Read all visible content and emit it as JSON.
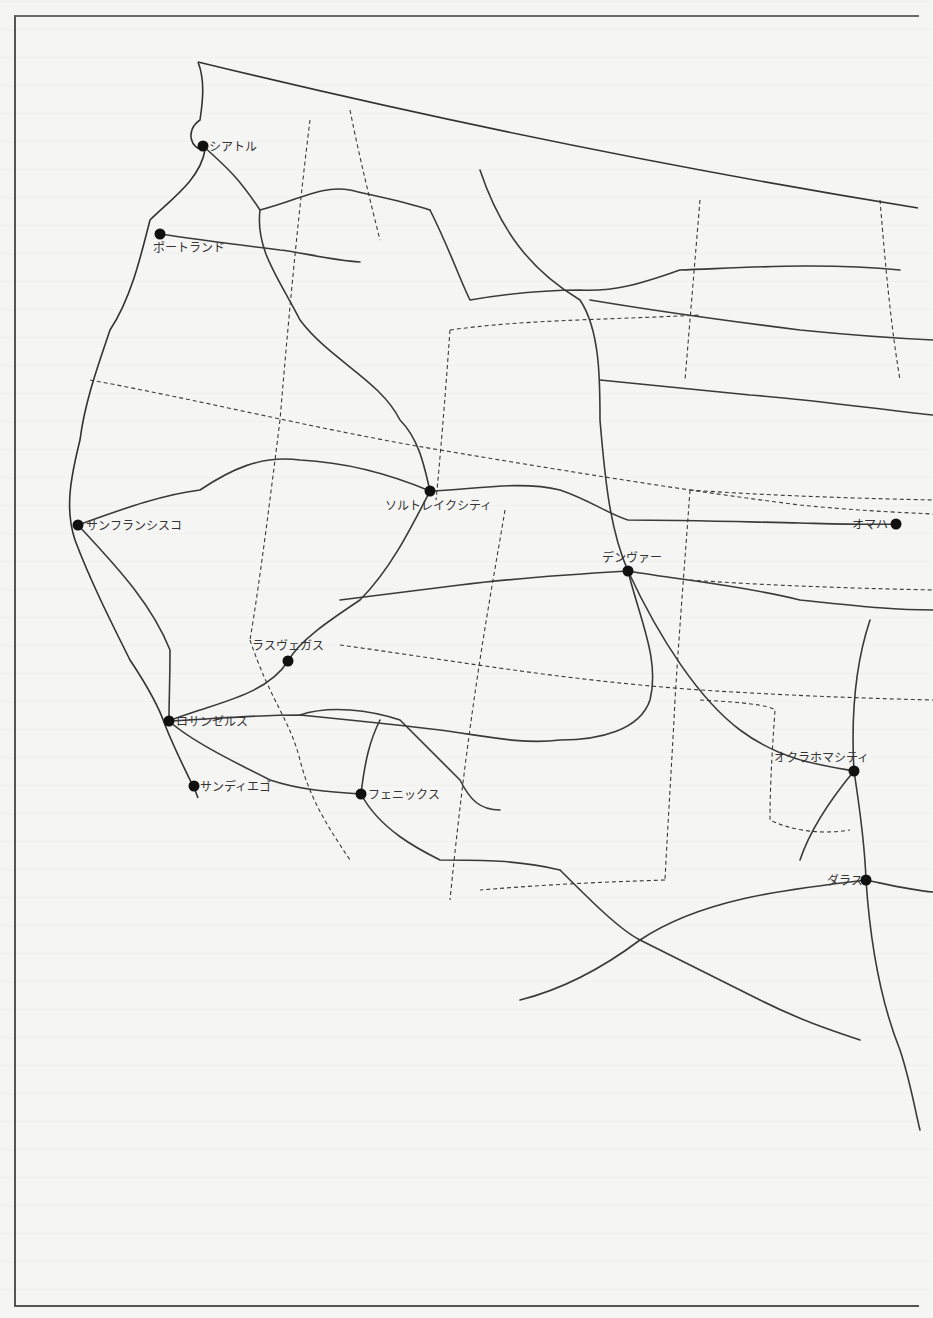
{
  "header": {
    "bleed_text": ""
  },
  "map": {
    "colors": {
      "line": "#3a3a3a",
      "dot": "#111111",
      "background": "#f5f5f3"
    },
    "cities": [
      {
        "id": "seattle",
        "label": "シアトル",
        "x": 203,
        "y": 146,
        "lx": 209,
        "ly": 151,
        "anchor": "start"
      },
      {
        "id": "portland",
        "label": "ポートランド",
        "x": 160,
        "y": 234,
        "lx": 153,
        "ly": 252,
        "anchor": "start"
      },
      {
        "id": "san-francisco",
        "label": "サンフランシスコ",
        "x": 78,
        "y": 525,
        "lx": 86,
        "ly": 530,
        "anchor": "start"
      },
      {
        "id": "salt-lake-city",
        "label": "ソルトレイクシティ",
        "x": 430,
        "y": 491,
        "lx": 385,
        "ly": 510,
        "anchor": "start"
      },
      {
        "id": "denver",
        "label": "デンヴァー",
        "x": 628,
        "y": 571,
        "lx": 602,
        "ly": 562,
        "anchor": "start"
      },
      {
        "id": "omaha",
        "label": "オマハ",
        "x": 896,
        "y": 524,
        "lx": 852,
        "ly": 529,
        "anchor": "start"
      },
      {
        "id": "las-vegas",
        "label": "ラスヴェガス",
        "x": 288,
        "y": 661,
        "lx": 252,
        "ly": 650,
        "anchor": "start"
      },
      {
        "id": "los-angeles",
        "label": "ロサンゼルス",
        "x": 169,
        "y": 721,
        "lx": 176,
        "ly": 726,
        "anchor": "start"
      },
      {
        "id": "san-diego",
        "label": "サンディエゴ",
        "x": 194,
        "y": 786,
        "lx": 200,
        "ly": 791,
        "anchor": "start"
      },
      {
        "id": "phoenix",
        "label": "フェニックス",
        "x": 361,
        "y": 794,
        "lx": 368,
        "ly": 799,
        "anchor": "start"
      },
      {
        "id": "oklahoma-city",
        "label": "オクラホマシティ",
        "x": 854,
        "y": 771,
        "lx": 774,
        "ly": 762,
        "anchor": "start"
      },
      {
        "id": "dallas",
        "label": "ダラス",
        "x": 866,
        "y": 880,
        "lx": 827,
        "ly": 885,
        "anchor": "start"
      }
    ],
    "canada_border": "M 198 62 Q 560 150 918 208",
    "coastline": "M 198 62 C 205 80 203 100 200 120 C 185 130 190 150 205 150 C 200 180 170 200 150 220 C 140 260 130 300 110 330 C 100 360 85 400 80 440 C 70 480 65 510 75 540 C 90 580 110 620 130 660 C 150 690 160 710 165 725 C 175 750 185 770 195 790 L 198 798",
    "routes": [
      "M 203 146 C 230 170 240 180 260 210 C 300 200 320 185 350 190 C 370 195 400 200 430 210",
      "M 160 234 C 200 240 240 245 280 250 C 300 252 330 260 360 262",
      "M 260 210 C 255 250 280 280 300 320 C 330 360 380 380 400 420 C 420 440 425 470 430 491",
      "M 430 210 C 450 250 460 280 470 300 C 500 295 540 290 580 290 C 620 292 650 280 680 270 C 740 268 820 262 900 270",
      "M 480 170 C 500 230 530 270 580 300 C 600 330 600 380 600 420 C 605 480 610 530 628 571",
      "M 590 300 C 650 310 720 320 800 330 C 850 335 890 338 933 340",
      "M 600 380 C 650 385 700 390 750 395 C 820 400 880 410 933 415",
      "M 430 491 C 470 490 520 480 560 490 C 590 500 610 515 628 520 C 680 520 750 522 800 523 C 840 524 870 525 896 524",
      "M 78 525 C 120 510 160 495 200 490 C 230 470 260 455 300 460 C 340 462 380 470 430 491",
      "M 78 525 C 110 560 150 600 170 650 C 170 680 169 700 169 721",
      "M 430 491 C 410 530 390 570 360 600 C 330 620 300 640 288 661",
      "M 628 571 C 560 575 500 580 460 585 C 420 590 380 595 340 600",
      "M 628 571 C 680 580 740 585 800 600 C 850 605 890 610 933 610",
      "M 628 571 C 640 620 660 660 650 700 C 640 730 600 740 560 740 C 520 745 480 735 440 730 C 400 725 350 720 300 715 C 250 715 200 720 169 721",
      "M 288 661 C 270 690 230 700 200 710 C 185 715 175 718 169 721",
      "M 169 721 C 190 740 230 760 270 780 C 300 790 330 792 361 794",
      "M 300 715 C 330 705 370 710 400 720 C 420 740 440 760 460 780 C 470 800 480 810 500 810",
      "M 361 794 C 365 760 370 740 380 720",
      "M 361 794 C 380 830 420 850 440 860 C 480 860 520 860 560 870",
      "M 628 571 C 660 640 700 700 740 730 C 780 760 820 765 854 771",
      "M 854 771 C 850 700 860 650 870 620",
      "M 854 771 C 860 810 865 850 866 880",
      "M 854 771 C 830 800 810 830 800 860",
      "M 866 880 C 780 890 700 900 640 940 C 600 970 560 990 520 1000",
      "M 866 880 C 870 940 880 1000 900 1050 C 910 1080 915 1110 920 1130",
      "M 640 940 C 680 960 720 980 760 1000 C 800 1020 830 1030 860 1040",
      "M 866 880 C 890 885 910 890 933 892",
      "M 560 870 C 590 900 620 930 640 940"
    ],
    "borders": [
      "M 90 380 C 200 400 320 430 440 450 C 560 470 680 490 800 505 C 850 510 890 512 933 514",
      "M 310 120 C 300 200 290 300 280 420",
      "M 350 110 C 360 160 370 200 380 240",
      "M 280 420 C 270 500 260 580 250 640",
      "M 450 330 C 520 320 600 320 700 315",
      "M 700 200 C 695 260 690 320 685 380",
      "M 880 200 C 885 260 890 320 900 380",
      "M 450 330 C 445 400 440 460 436 500",
      "M 690 490 C 760 495 840 498 933 500",
      "M 690 580 C 760 585 840 588 933 590",
      "M 505 510 C 490 600 470 700 450 900",
      "M 690 490 C 685 560 680 620 675 700",
      "M 340 645 C 450 660 560 680 700 690 C 780 695 850 698 933 700",
      "M 675 700 C 672 760 668 820 665 880",
      "M 700 700 C 740 702 770 705 775 710 C 773 740 770 780 770 820 C 790 830 820 835 850 830",
      "M 250 640 C 270 700 290 720 300 760 C 310 800 330 830 350 860",
      "M 665 880 C 600 882 540 885 480 890"
    ]
  }
}
